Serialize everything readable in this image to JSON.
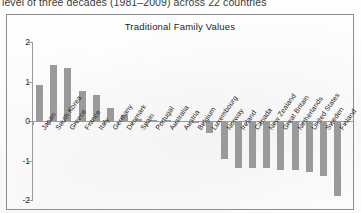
{
  "document": {
    "caption_clipped": "level of three decades (1981–2009) across 22 countries"
  },
  "chart_data": {
    "type": "bar",
    "title": "Traditional Family Values",
    "xlabel": "",
    "ylabel": "",
    "ylim": [
      -2,
      2
    ],
    "yticks": [
      2,
      1,
      0,
      -1,
      -2
    ],
    "ytick_labels": [
      "2",
      "1",
      "0",
      "-1",
      "-2"
    ],
    "grid": false,
    "legend": null,
    "bar_color": "#9a9a9a",
    "axis_color": "#9b9b9b",
    "categories": [
      "Japan",
      "South Korea",
      "Greece",
      "France",
      "Italy",
      "Germany",
      "Denmark",
      "Spain",
      "Portugal",
      "Australia",
      "Austria",
      "Belgium",
      "Luxembourg",
      "Norway",
      "Ireland",
      "Canada",
      "New Zealand",
      "Great Britain",
      "Netherlands",
      "United States",
      "Sweden",
      "Finland"
    ],
    "values": [
      0.92,
      1.42,
      1.33,
      0.77,
      0.67,
      0.32,
      0.14,
      0.05,
      0.03,
      0.02,
      -0.02,
      -0.05,
      -0.3,
      -0.95,
      -1.2,
      -1.2,
      -1.2,
      -1.25,
      -1.25,
      -1.3,
      -1.4,
      -1.9
    ]
  }
}
